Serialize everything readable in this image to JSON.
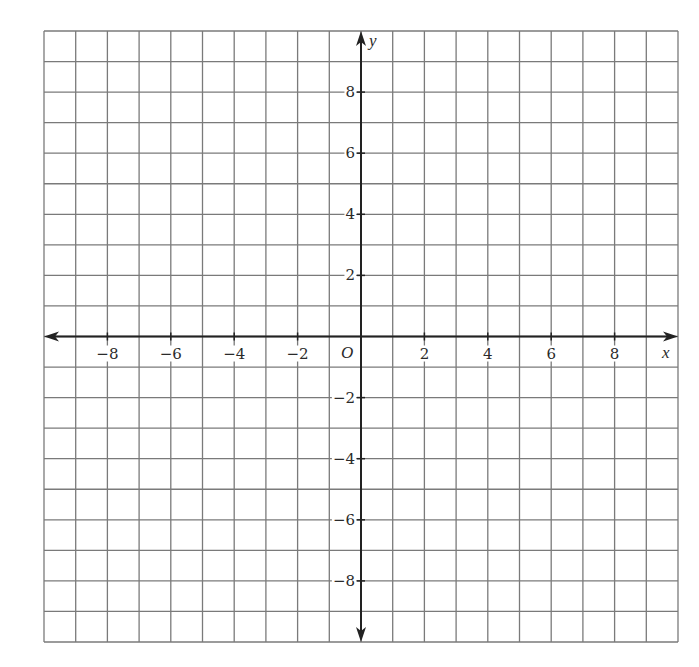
{
  "chart_data": {
    "type": "coordinate-grid",
    "title": "",
    "xlabel": "x",
    "ylabel": "y",
    "origin_label": "O",
    "xlim": [
      -10,
      10
    ],
    "ylim": [
      -10,
      10
    ],
    "grid": true,
    "grid_step": 1,
    "x_ticks": [
      -8,
      -6,
      -4,
      -2,
      2,
      4,
      6,
      8
    ],
    "y_ticks": [
      8,
      6,
      4,
      2,
      -2,
      -4,
      -6,
      -8
    ],
    "x_tick_labels": [
      "−8",
      "−6",
      "−4",
      "−2",
      "2",
      "4",
      "6",
      "8"
    ],
    "y_tick_labels": [
      "8",
      "6",
      "4",
      "2",
      "−2",
      "−4",
      "−6",
      "−8"
    ],
    "points": [],
    "series": []
  },
  "colors": {
    "grid": "#7a7a7a",
    "axis": "#222222",
    "background": "#ffffff"
  }
}
